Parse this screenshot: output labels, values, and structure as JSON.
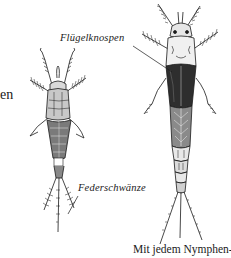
{
  "figure": {
    "labels": {
      "wing_buds": "Flügelknospen",
      "feather_tails": "Federschwänze"
    },
    "left_margin_fragment": "en",
    "caption_fragment": "Mit jedem Nymphen-",
    "colors": {
      "ink": "#1a1a1a",
      "shade": "#555555",
      "light": "#9a9a9a",
      "background": "#ffffff"
    }
  }
}
